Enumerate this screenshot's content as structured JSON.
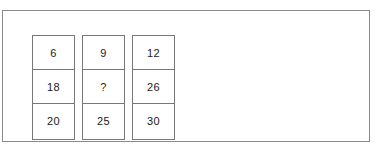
{
  "frame": {
    "border_color": "#8a8a8a",
    "background": "#ffffff"
  },
  "puzzle": {
    "title": "",
    "cell_border_color": "#777777",
    "text_color": "#1a1a1a",
    "unknown_marker": "?",
    "columns": [
      {
        "name": "column-1",
        "cells": [
          {
            "value": "6"
          },
          {
            "value": "18"
          },
          {
            "value": "20"
          }
        ]
      },
      {
        "name": "column-2",
        "cells": [
          {
            "value": "9"
          },
          {
            "value": "?"
          },
          {
            "value": "25"
          }
        ]
      },
      {
        "name": "column-3",
        "cells": [
          {
            "value": "12"
          },
          {
            "value": "26"
          },
          {
            "value": "30"
          }
        ]
      }
    ]
  }
}
